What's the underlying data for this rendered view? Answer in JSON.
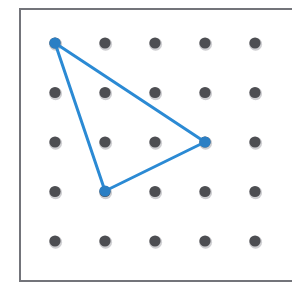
{
  "figure": {
    "kind": "geoboard-diagram",
    "background_color": "#ffffff"
  },
  "board": {
    "name": "geoboard",
    "frame": {
      "x": 19,
      "y": 8,
      "width": 292,
      "height": 274,
      "border_color": "#73747a",
      "border_width": 2,
      "fill_color": "#ffffff",
      "right_edge_cropped": true
    },
    "grid": {
      "rows": 5,
      "cols": 5,
      "origin_x": 55,
      "origin_y": 43,
      "spacing_x": 50,
      "spacing_y": 49.5
    },
    "peg": {
      "radius": 5.6,
      "color": "#4d4e52",
      "shadow_color": "#cfcfd2",
      "shadow_offset_x": 0.6,
      "shadow_offset_y": 1.2
    },
    "peg_labels": [
      [
        "r0c0",
        "r0c1",
        "r0c2",
        "r0c3",
        "r0c4"
      ],
      [
        "r1c0",
        "r1c1",
        "r1c2",
        "r1c3",
        "r1c4"
      ],
      [
        "r2c0",
        "r2c1",
        "r2c2",
        "r2c3",
        "r2c4"
      ],
      [
        "r3c0",
        "r3c1",
        "r3c2",
        "r3c3",
        "r3c4"
      ],
      [
        "r4c0",
        "r4c1",
        "r4c2",
        "r4c3",
        "r4c4"
      ]
    ]
  },
  "shape": {
    "name": "triangle",
    "type": "polygon",
    "stroke_color": "#2b8ad4",
    "stroke_width": 3,
    "fill": "none",
    "vertices": [
      {
        "label": "A",
        "grid_col": 0,
        "grid_row": 0,
        "x": 55,
        "y": 43
      },
      {
        "label": "B",
        "grid_col": 3,
        "grid_row": 2,
        "x": 205,
        "y": 142
      },
      {
        "label": "C",
        "grid_col": 1,
        "grid_row": 3,
        "x": 105,
        "y": 191
      }
    ],
    "edges": [
      {
        "label": "A-B",
        "from": "A",
        "to": "B"
      },
      {
        "label": "B-C",
        "from": "B",
        "to": "C"
      },
      {
        "label": "C-A",
        "from": "C",
        "to": "A"
      }
    ],
    "vertex_marker": {
      "radius": 5.6,
      "color": "#2b7fc4"
    }
  }
}
